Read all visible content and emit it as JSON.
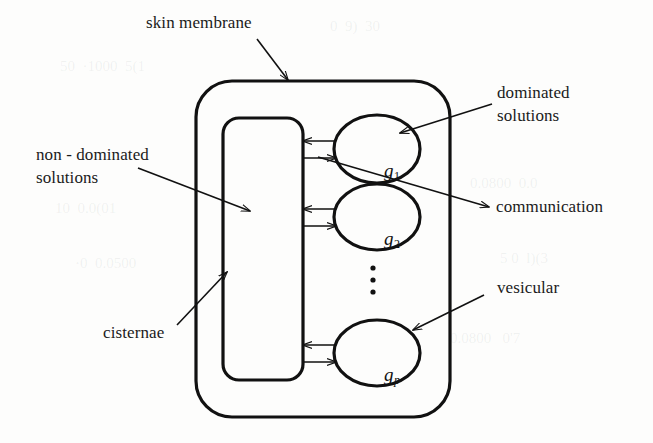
{
  "diagram": {
    "labels": {
      "skin_membrane": "skin membrane",
      "dominated_solutions_line1": "dominated",
      "dominated_solutions_line2": "solutions",
      "non_dominated_line1": "non - dominated",
      "non_dominated_line2": "solutions",
      "communication": "communication",
      "vesicular": "vesicular",
      "cisternae": "cisternae"
    },
    "nodes": [
      {
        "id": "g1",
        "base": "g",
        "sub": "1",
        "sub_italic": false
      },
      {
        "id": "g2",
        "base": "g",
        "sub": "2",
        "sub_italic": false
      },
      {
        "id": "gp",
        "base": "g",
        "sub": "p",
        "sub_italic": true
      }
    ],
    "ellipsis": "⋮",
    "colors": {
      "stroke": "#111111",
      "background": "#fdfdfc",
      "text": "#1a1a1a"
    },
    "artifacts": [
      "50  ·1000  5(1",
      "0  9)  30",
      "0.0800  0.0",
      "10  0.0(01",
      "5 0  l)(3",
      "·0  0.0500",
      "0.0800   0'7"
    ]
  }
}
